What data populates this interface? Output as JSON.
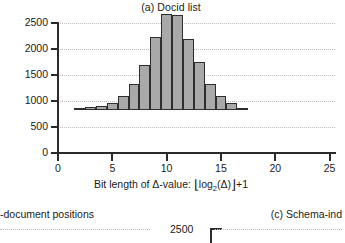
{
  "figure": {
    "panel_a": {
      "title": "(a) Docid list",
      "xlabel_prefix": "Bit length of ",
      "xlabel_delta": "Δ-value:",
      "xlabel_floor_open": "⌊",
      "xlabel_log": "log",
      "xlabel_log_sub": "2",
      "xlabel_arg": "(Δ)",
      "xlabel_floor_close": "⌋",
      "xlabel_suffix": "+1"
    },
    "cropped_neighbours": {
      "left_caption": "-document positions",
      "right_caption": "(c) Schema-ind",
      "bottom_axis_label": "2500"
    }
  },
  "colors": {
    "bar_fill": "#a9a9a9",
    "bar_stroke": "#2e2e2e",
    "axis": "#2b2b2b",
    "grid": "#bdbdbd",
    "text": "#1b1b1b",
    "background": "#ffffff"
  },
  "chart_data": {
    "type": "bar",
    "title": "(a) Docid list",
    "xlabel": "Bit length of Δ-value: ⌊log₂(Δ)⌋+1",
    "ylabel": "",
    "xlim": [
      0,
      25.5
    ],
    "ylim": [
      0,
      2500
    ],
    "xticks": [
      0,
      5,
      10,
      15,
      20,
      25
    ],
    "yticks": [
      0,
      500,
      1000,
      1500,
      2000,
      2500
    ],
    "xtick_labels": [
      "0",
      "5",
      "10",
      "15",
      "20",
      "25"
    ],
    "ytick_labels": [
      "0",
      "500",
      "1000",
      "1500",
      "2000",
      "2500"
    ],
    "grid": "horizontal-dotted",
    "legend": null,
    "bar_width_units": 1,
    "categories": [
      2,
      3,
      4,
      5,
      6,
      7,
      8,
      9,
      10,
      11,
      12,
      13,
      14,
      15,
      16,
      17
    ],
    "values": [
      20,
      55,
      70,
      135,
      270,
      500,
      870,
      1395,
      1855,
      1830,
      1370,
      920,
      500,
      270,
      130,
      25
    ]
  }
}
